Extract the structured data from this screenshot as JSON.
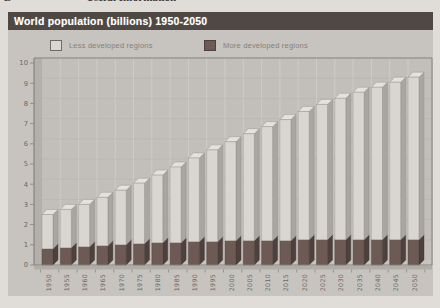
{
  "page_header": {
    "left_fragment": "B",
    "title_fragment": "Useful Information"
  },
  "title_bar": {
    "text": "World population (billions) 1950-2050"
  },
  "legend": {
    "items": [
      {
        "label": "Less developed regions",
        "swatch": "light"
      },
      {
        "label": "More developed regions",
        "swatch": "dark"
      }
    ]
  },
  "chart_data": {
    "type": "bar",
    "stacked": true,
    "three_d": true,
    "title": "World population (billions) 1950-2050",
    "xlabel": "",
    "ylabel": "",
    "ylim": [
      0,
      10
    ],
    "yticks": [
      0,
      1,
      2,
      3,
      4,
      5,
      6,
      7,
      8,
      9,
      10
    ],
    "grid": true,
    "legend_position": "top",
    "categories": [
      "1950",
      "1955",
      "1960",
      "1965",
      "1970",
      "1975",
      "1980",
      "1985",
      "1990",
      "1995",
      "2000",
      "2005",
      "2010",
      "2015",
      "2020",
      "2025",
      "2030",
      "2035",
      "2040",
      "2045",
      "2050"
    ],
    "series": [
      {
        "name": "More developed regions",
        "stack_position": "bottom",
        "values": [
          0.8,
          0.85,
          0.9,
          0.95,
          1.0,
          1.05,
          1.1,
          1.1,
          1.15,
          1.15,
          1.2,
          1.2,
          1.2,
          1.2,
          1.25,
          1.25,
          1.25,
          1.25,
          1.25,
          1.25,
          1.25
        ]
      },
      {
        "name": "Less developed regions",
        "stack_position": "top",
        "values": [
          1.7,
          1.9,
          2.1,
          2.4,
          2.7,
          3.0,
          3.35,
          3.75,
          4.15,
          4.55,
          4.9,
          5.3,
          5.65,
          6.0,
          6.35,
          6.7,
          7.0,
          7.3,
          7.55,
          7.8,
          8.05
        ]
      }
    ],
    "totals": [
      2.5,
      2.75,
      3.0,
      3.35,
      3.7,
      4.05,
      4.45,
      4.85,
      5.3,
      5.7,
      6.1,
      6.5,
      6.85,
      7.2,
      7.6,
      7.95,
      8.25,
      8.55,
      8.8,
      9.05,
      9.3
    ]
  },
  "colors": {
    "titlebar_bg": "#4f4843",
    "titlebar_text": "#ffffff",
    "panel_bg": "#c7c4bf",
    "plot_bg": "#c2bfba",
    "wall": "#b3b0ab",
    "floor": "#b0ada8",
    "grid_vertical": "#cfccc7",
    "grid_horizontal": "#b8b5b0",
    "frame": "#85827d",
    "axis_text": "#6b6865",
    "bar_light_front": "#d9d6d1",
    "bar_light_side": "#a9a6a1",
    "bar_light_top": "#e5e2dd",
    "bar_light_outline": "#8f8c87",
    "bar_dark_front": "#6d5a55",
    "bar_dark_side": "#4e403c",
    "bar_dark_outline": "#443a36"
  }
}
